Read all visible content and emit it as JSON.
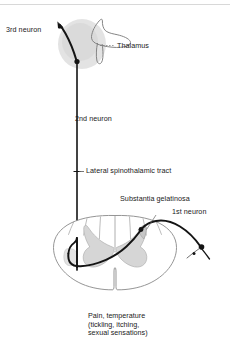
{
  "figure": {
    "labels": {
      "third_neuron": "3rd neuron",
      "thalamus": "Thalamus",
      "second_neuron": "2nd neuron",
      "lateral_spinothalamic_tract": "Lateral spinothalamic tract",
      "substantia_gelatinosa": "Substantia gelatinosa",
      "first_neuron": "1st neuron"
    },
    "caption": {
      "line1": "Pain, temperature",
      "line2": "(tickling, itching,",
      "line3": "sexual sensations)"
    },
    "colors": {
      "background": "#ffffff",
      "text": "#1a1a1a",
      "pathway_stroke": "#111111",
      "outline_stroke": "#8a8a8a",
      "gray_matter_fill": "#d9d9d9",
      "thalamus_blob_fill": "#dcdcdc",
      "leader_line": "#6e6e6e",
      "top_rule": "#d0d0d0"
    }
  }
}
